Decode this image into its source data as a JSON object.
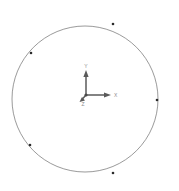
{
  "viewport": {
    "name": "3d-sketch-viewport",
    "width": 179,
    "height": 191,
    "background_color": "#ffffff"
  },
  "geometry": {
    "circle": {
      "label": "sketch-circle",
      "center_x": 85,
      "center_y": 99,
      "radius": 73,
      "stroke_color": "#6e6e6e",
      "stroke_width": 0.7,
      "fill": "none"
    },
    "vertex_markers": [
      {
        "label": "vertex-upper-left",
        "x": 31,
        "y": 53,
        "color": "#2b2b2b",
        "radius": 1.3
      },
      {
        "label": "vertex-upper-right",
        "x": 113,
        "y": 24,
        "color": "#2b2b2b",
        "radius": 1.3
      },
      {
        "label": "vertex-right",
        "x": 157,
        "y": 100,
        "color": "#2b2b2b",
        "radius": 1.3
      },
      {
        "label": "vertex-lower-left",
        "x": 30,
        "y": 145,
        "color": "#2b2b2b",
        "radius": 1.3
      },
      {
        "label": "vertex-bottom",
        "x": 113,
        "y": 173,
        "color": "#2b2b2b",
        "radius": 1.3
      }
    ]
  },
  "axis_triad": {
    "name": "coordinate-axis-triad",
    "origin_x": 86,
    "origin_y": 95,
    "color": "#5a5a5a",
    "label_color": "#9a9a9a",
    "axes": [
      {
        "id": "y-axis",
        "label": "Y",
        "tip_x": 86,
        "tip_y": 71,
        "label_x": 86,
        "label_y": 68
      },
      {
        "id": "x-axis",
        "label": "X",
        "tip_x": 110,
        "tip_y": 95,
        "label_x": 114,
        "label_y": 95
      },
      {
        "id": "z-axis",
        "label": "Z",
        "tip_x": 80,
        "tip_y": 101,
        "label_x": 83,
        "label_y": 105
      }
    ]
  }
}
